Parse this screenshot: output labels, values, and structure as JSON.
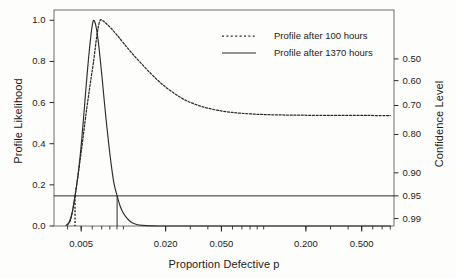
{
  "chart_data": {
    "type": "line",
    "title": "",
    "xlabel": "Proportion Defective p",
    "ylabel": "Profile Likelihood",
    "y2label": "Confidence Level",
    "xscale": "log",
    "xlim": [
      0.0032,
      0.85
    ],
    "ylim": [
      0.0,
      1.05
    ],
    "grid": false,
    "legend_position": "upper center",
    "xticks": [
      {
        "value": 0.005,
        "label": "0.005"
      },
      {
        "value": 0.02,
        "label": "0.020"
      },
      {
        "value": 0.05,
        "label": "0.050"
      },
      {
        "value": 0.2,
        "label": "0.200"
      },
      {
        "value": 0.5,
        "label": "0.500"
      }
    ],
    "yticks_left": [
      {
        "value": 0.0,
        "label": "0.0"
      },
      {
        "value": 0.2,
        "label": "0.2"
      },
      {
        "value": 0.4,
        "label": "0.4"
      },
      {
        "value": 0.6,
        "label": "0.6"
      },
      {
        "value": 0.8,
        "label": "0.8"
      },
      {
        "value": 1.0,
        "label": "1.0"
      }
    ],
    "yticks_right": [
      {
        "likelihood": 0.8122,
        "label": "0.50"
      },
      {
        "likelihood": 0.7066,
        "label": "0.60"
      },
      {
        "likelihood": 0.5858,
        "label": "0.70"
      },
      {
        "likelihood": 0.4449,
        "label": "0.80"
      },
      {
        "likelihood": 0.2585,
        "label": "0.90"
      },
      {
        "likelihood": 0.1465,
        "label": "0.95"
      },
      {
        "likelihood": 0.0362,
        "label": "0.99"
      }
    ],
    "reference_line": {
      "name": "95% confidence threshold",
      "y": 0.1465,
      "style": "solid"
    },
    "series": [
      {
        "name": "Profile after 100 hours",
        "style": "dotted",
        "color": "#2b2b2b",
        "mle": 0.0068,
        "ci95": [
          0.00452,
          0.85
        ],
        "points": [
          [
            0.004,
            0.005
          ],
          [
            0.0042,
            0.03
          ],
          [
            0.0044,
            0.095
          ],
          [
            0.00452,
            0.1465
          ],
          [
            0.0047,
            0.225
          ],
          [
            0.0049,
            0.315
          ],
          [
            0.0051,
            0.405
          ],
          [
            0.0053,
            0.495
          ],
          [
            0.0055,
            0.58
          ],
          [
            0.0057,
            0.655
          ],
          [
            0.0059,
            0.725
          ],
          [
            0.0061,
            0.79
          ],
          [
            0.0063,
            0.865
          ],
          [
            0.0065,
            0.935
          ],
          [
            0.0068,
            0.998
          ],
          [
            0.0072,
            0.996
          ],
          [
            0.0076,
            0.982
          ],
          [
            0.0082,
            0.96
          ],
          [
            0.009,
            0.928
          ],
          [
            0.01,
            0.89
          ],
          [
            0.0115,
            0.84
          ],
          [
            0.0135,
            0.788
          ],
          [
            0.016,
            0.735
          ],
          [
            0.019,
            0.688
          ],
          [
            0.023,
            0.645
          ],
          [
            0.028,
            0.61
          ],
          [
            0.035,
            0.584
          ],
          [
            0.045,
            0.565
          ],
          [
            0.06,
            0.552
          ],
          [
            0.08,
            0.545
          ],
          [
            0.11,
            0.541
          ],
          [
            0.16,
            0.539
          ],
          [
            0.24,
            0.538
          ],
          [
            0.36,
            0.5375
          ],
          [
            0.55,
            0.5372
          ],
          [
            0.8,
            0.537
          ]
        ]
      },
      {
        "name": "Profile after 1370 hours",
        "style": "solid",
        "color": "#2b2b2b",
        "mle": 0.0061,
        "ci95": [
          0.00452,
          0.00902
        ],
        "points": [
          [
            0.0039,
            0.003
          ],
          [
            0.0041,
            0.018
          ],
          [
            0.0043,
            0.062
          ],
          [
            0.00452,
            0.1465
          ],
          [
            0.0047,
            0.225
          ],
          [
            0.0049,
            0.33
          ],
          [
            0.00505,
            0.425
          ],
          [
            0.0052,
            0.525
          ],
          [
            0.00535,
            0.63
          ],
          [
            0.0055,
            0.73
          ],
          [
            0.00565,
            0.82
          ],
          [
            0.0058,
            0.895
          ],
          [
            0.00595,
            0.96
          ],
          [
            0.0061,
            0.998
          ],
          [
            0.00625,
            0.993
          ],
          [
            0.0064,
            0.965
          ],
          [
            0.0066,
            0.905
          ],
          [
            0.0068,
            0.825
          ],
          [
            0.00705,
            0.72
          ],
          [
            0.0073,
            0.61
          ],
          [
            0.0076,
            0.49
          ],
          [
            0.0079,
            0.385
          ],
          [
            0.0082,
            0.295
          ],
          [
            0.00855,
            0.21
          ],
          [
            0.00902,
            0.1465
          ],
          [
            0.0095,
            0.095
          ],
          [
            0.01,
            0.062
          ],
          [
            0.0106,
            0.038
          ],
          [
            0.0112,
            0.022
          ],
          [
            0.012,
            0.011
          ],
          [
            0.013,
            0.005
          ],
          [
            0.0145,
            0.0015
          ],
          [
            0.016,
            0.0004
          ],
          [
            0.018,
            0.0
          ],
          [
            0.022,
            0.0
          ],
          [
            0.03,
            0.0
          ],
          [
            0.05,
            0.0
          ],
          [
            0.1,
            0.0
          ],
          [
            0.3,
            0.0
          ],
          [
            0.8,
            0.0
          ]
        ]
      }
    ],
    "drop_lines": [
      {
        "name": "dotted-lower-bound",
        "x": 0.00452,
        "style": "dotted",
        "y_top": 0.1465
      },
      {
        "name": "solid-upper-bound",
        "x": 0.00902,
        "style": "solid",
        "y_top": 0.1465
      }
    ]
  },
  "legend": {
    "entries": [
      {
        "label": "Profile after 100 hours",
        "style": "dotted"
      },
      {
        "label": "Profile after 1370 hours",
        "style": "solid"
      }
    ]
  },
  "axes": {
    "x_title": "Proportion Defective p",
    "y_left_title": "Profile Likelihood",
    "y_right_title": "Confidence Level"
  },
  "colors": {
    "ink": "#2b2b2b",
    "frame": "#6f6f6f",
    "background": "#fdfdfc"
  }
}
